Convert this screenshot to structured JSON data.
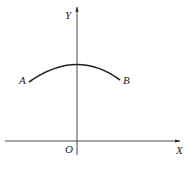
{
  "figure": {
    "axes": {
      "x_label": "X",
      "y_label": "Y",
      "origin_label": "O"
    },
    "curve": {
      "start_label": "A",
      "end_label": "B",
      "shape": "concave-down arc peaking at the Y axis"
    },
    "colors": {
      "ink": "#222222",
      "caption": "#b8d4ea"
    },
    "caption": ""
  }
}
